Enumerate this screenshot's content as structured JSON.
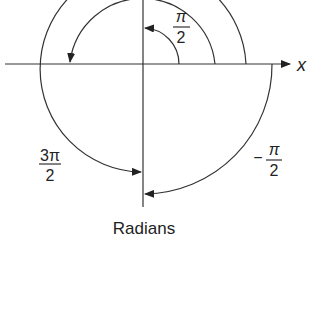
{
  "diagram": {
    "caption": "Radians",
    "axis_label_x": "x",
    "angles": [
      {
        "id": "pi_over_2",
        "numerator": "π",
        "denominator": "2",
        "sign": ""
      },
      {
        "id": "pi",
        "numerator": "π",
        "denominator": "",
        "sign": ""
      },
      {
        "id": "three_pi_over_2",
        "numerator": "3π",
        "denominator": "2",
        "sign": ""
      },
      {
        "id": "neg_pi_over_2",
        "numerator": "π",
        "denominator": "2",
        "sign": "−"
      }
    ],
    "colors": {
      "stroke": "#333333",
      "text": "#222222",
      "background": "#ffffff"
    }
  }
}
